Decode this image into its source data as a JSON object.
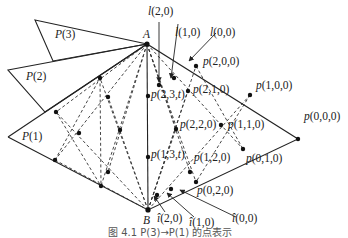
{
  "figure": {
    "vertices": {
      "A": {
        "label": "A",
        "x": 147,
        "y": 44
      },
      "B": {
        "label": "B",
        "x": 148,
        "y": 210
      }
    },
    "polytopes": [
      {
        "label": "P(3)",
        "points": [
          [
            35,
            20
          ],
          [
            147,
            44
          ],
          [
            53,
            61
          ]
        ],
        "label_pos": [
          55,
          38
        ]
      },
      {
        "label": "P(2)",
        "points": [
          [
            8,
            70
          ],
          [
            147,
            44
          ],
          [
            45,
            112
          ]
        ],
        "label_pos": [
          26,
          80
        ]
      },
      {
        "label": "P(1)",
        "points": [
          [
            8,
            137
          ],
          [
            147,
            44
          ],
          [
            148,
            210
          ]
        ],
        "label_pos": [
          22,
          140
        ]
      }
    ],
    "points": [
      {
        "label": "p(0,0,0)",
        "x": 298,
        "y": 139,
        "lx": 304,
        "ly": 120
      },
      {
        "label": "p(1,0,0)",
        "x": 250,
        "y": 95,
        "lx": 256,
        "ly": 89
      },
      {
        "label": "p(2,0,0)",
        "x": 196,
        "y": 66,
        "lx": 203,
        "ly": 65
      },
      {
        "label": "p(0,1,0)",
        "x": 243,
        "y": 149,
        "lx": 246,
        "ly": 162
      },
      {
        "label": "p(0,2,0)",
        "x": 196,
        "y": 182,
        "lx": 197,
        "ly": 194
      },
      {
        "label": "p(2,1,0)",
        "x": 188,
        "y": 91,
        "lx": 193,
        "ly": 93
      },
      {
        "label": "p(1,1,0)",
        "x": 221,
        "y": 125,
        "lx": 228,
        "ly": 128
      },
      {
        "label": "p(2,2,0)",
        "x": 176,
        "y": 129,
        "lx": 180,
        "ly": 128
      },
      {
        "label": "p(1,2,0)",
        "x": 190,
        "y": 172,
        "lx": 194,
        "ly": 161
      },
      {
        "label": "p(2,3,t)",
        "x": 148,
        "y": 96,
        "lx": 151,
        "ly": 98
      },
      {
        "label": "p(1,3,t)",
        "x": 148,
        "y": 157,
        "lx": 151,
        "ly": 158
      }
    ],
    "unlabeled_points": [
      [
        100,
        78
      ],
      [
        108,
        97
      ],
      [
        56,
        112
      ],
      [
        79,
        133
      ],
      [
        120,
        130
      ],
      [
        55,
        160
      ],
      [
        108,
        172
      ],
      [
        101,
        186
      ],
      [
        159,
        85
      ],
      [
        174,
        78
      ],
      [
        157,
        195
      ],
      [
        171,
        189
      ]
    ],
    "arrows": [
      {
        "label": "l(2,0)",
        "from": [
          159,
          22
        ],
        "to": [
          159,
          82
        ],
        "lx": 148,
        "ly": 15
      },
      {
        "label": "l(1,0)",
        "from": [
          178,
          24
        ],
        "to": [
          171,
          78
        ],
        "lx": 175,
        "ly": 36
      },
      {
        "label": "l(0,0)",
        "from": [
          216,
          33
        ],
        "to": [
          189,
          61
        ],
        "lx": 210,
        "ly": 36
      },
      {
        "label": "î(2,0)",
        "from": [
          165,
          212
        ],
        "to": [
          154,
          196
        ],
        "lx": 157,
        "ly": 222
      },
      {
        "label": "î(1,0)",
        "from": [
          194,
          217
        ],
        "to": [
          167,
          193
        ],
        "lx": 189,
        "ly": 226
      },
      {
        "label": "î(0,0)",
        "from": [
          236,
          217
        ],
        "to": [
          180,
          190
        ],
        "lx": 232,
        "ly": 222
      }
    ],
    "caption": "图 4.1   P(3)→P(1) 的点表示"
  }
}
